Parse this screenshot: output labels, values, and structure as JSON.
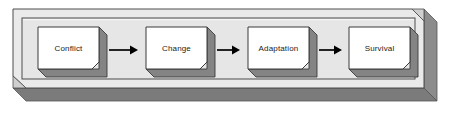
{
  "diagram": {
    "type": "linear-process-flow",
    "frame": {
      "name": "outer-3d-frame",
      "fill": "#e9e9e9",
      "top_face": "#f2f2f2",
      "side_shadow": "#8f8f8f",
      "bottom_shadow": "#7d7d7d",
      "border": "#4a4a4a",
      "inner_panel_fill": "#e6e6e6"
    },
    "node_style": {
      "face_fill": "#ffffff",
      "extrusion_fill": "#828282",
      "extrusion_dark": "#6e6e6e",
      "border": "#3a3a3a",
      "bevel": 7
    },
    "arrow_style": {
      "color": "#000000",
      "line_width": 1.6,
      "head_length": 7,
      "head_width": 7
    },
    "nodes": [
      {
        "id": "node-conflict",
        "label": "Conflict",
        "x": 31,
        "y": 27,
        "w": 68,
        "h": 42
      },
      {
        "id": "node-change",
        "label": "Change",
        "x": 139,
        "y": 27,
        "w": 68,
        "h": 42
      },
      {
        "id": "node-adaptation",
        "label": "Adaptation",
        "x": 241,
        "y": 27,
        "w": 68,
        "h": 42
      },
      {
        "id": "node-survival",
        "label": "Survival",
        "x": 342,
        "y": 27,
        "w": 68,
        "h": 42
      }
    ],
    "arrows": [
      {
        "id": "arrow-conflict-to-change",
        "from": "Conflict",
        "to": "Change",
        "x1": 110,
        "x2": 136,
        "y": 50
      },
      {
        "id": "arrow-change-to-adaptation",
        "from": "Change",
        "to": "Adaptation",
        "x1": 212,
        "x2": 238,
        "y": 50
      },
      {
        "id": "arrow-adaptation-to-survival",
        "from": "Adaptation",
        "to": "Survival",
        "x1": 314,
        "x2": 339,
        "y": 50
      }
    ]
  }
}
